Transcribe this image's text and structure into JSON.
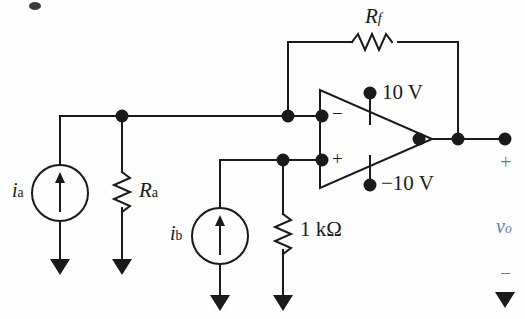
{
  "diagram": {
    "type": "circuit-schematic",
    "colors": {
      "wire": "#1a1a1a",
      "node": "#111111",
      "label": "#1a1a1a",
      "output_label": "#5b7fa6",
      "background": "#fefefe"
    },
    "components": {
      "source_a": {
        "label": "i",
        "subscript": "a",
        "kind": "current-source",
        "direction": "up"
      },
      "source_b": {
        "label": "i",
        "subscript": "b",
        "kind": "current-source",
        "direction": "up"
      },
      "resistor_a": {
        "label": "R",
        "subscript": "a",
        "kind": "resistor"
      },
      "resistor_f": {
        "label": "R",
        "subscript": "f",
        "kind": "resistor"
      },
      "resistor_1k": {
        "label": "1 kΩ",
        "kind": "resistor"
      },
      "opamp": {
        "kind": "operational-amplifier",
        "inverting_label": "−",
        "noninverting_label": "+",
        "supply_positive": "10 V",
        "supply_negative": "−10 V"
      },
      "output": {
        "plus": "+",
        "minus": "−",
        "label": "v",
        "subscript": "o"
      }
    }
  }
}
